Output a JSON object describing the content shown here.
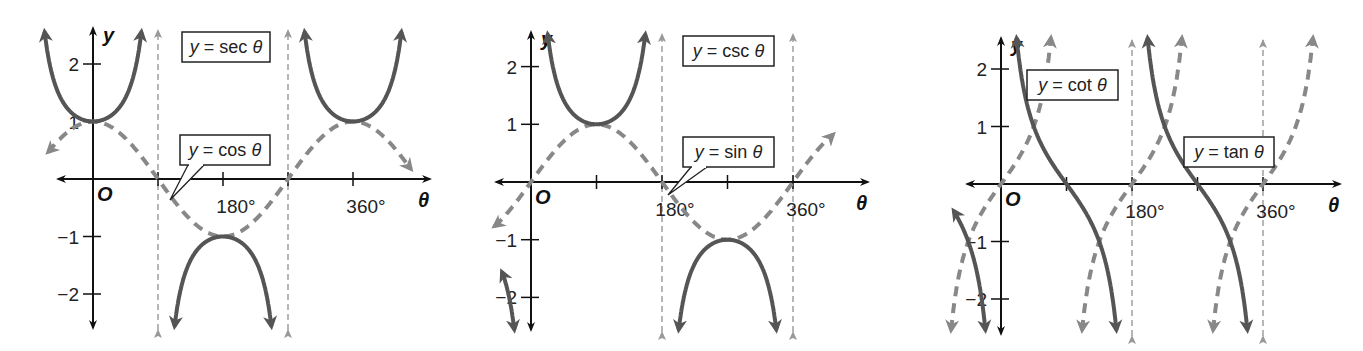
{
  "chart_data": [
    {
      "type": "line",
      "title": "",
      "xlabel": "θ",
      "ylabel": "y",
      "origin_label": "O",
      "x_unit": "degrees",
      "xlim": [
        -75,
        475
      ],
      "ylim": [
        -2.5,
        2.5
      ],
      "x_ticks": [
        90,
        180,
        270,
        360
      ],
      "x_tick_labels": [
        {
          "value": 180,
          "label": "180°"
        },
        {
          "value": 360,
          "label": "360°"
        }
      ],
      "y_ticks": [
        {
          "value": 2,
          "label": "2"
        },
        {
          "value": 1,
          "label": "1"
        },
        {
          "value": -1,
          "label": "−1"
        },
        {
          "value": -2,
          "label": "−2"
        }
      ],
      "asymptotes": [
        90,
        270
      ],
      "grid": false,
      "series": [
        {
          "name": "y = sec θ",
          "function": "sec",
          "style": "solid",
          "color": "#555555",
          "x_range": [
            -70,
            450
          ]
        },
        {
          "name": "y = cos θ",
          "function": "cos",
          "style": "dashed",
          "color": "#888888",
          "x_range": [
            -62,
            440
          ]
        }
      ],
      "annotations": [
        {
          "text_parts": [
            "y",
            " = sec ",
            "θ"
          ],
          "callout": false
        },
        {
          "text_parts": [
            "y",
            " = cos ",
            "θ"
          ],
          "callout": true,
          "points_to_x": 100
        }
      ]
    },
    {
      "type": "line",
      "title": "",
      "xlabel": "θ",
      "ylabel": "y",
      "origin_label": "O",
      "x_unit": "degrees",
      "xlim": [
        -75,
        475
      ],
      "ylim": [
        -2.5,
        2.5
      ],
      "x_ticks": [
        90,
        180,
        270,
        360
      ],
      "x_tick_labels": [
        {
          "value": 180,
          "label": "180°"
        },
        {
          "value": 360,
          "label": "360°"
        }
      ],
      "y_ticks": [
        {
          "value": 2,
          "label": "2"
        },
        {
          "value": 1,
          "label": "1"
        },
        {
          "value": -1,
          "label": "−1"
        },
        {
          "value": -2,
          "label": "−2"
        }
      ],
      "asymptotes": [
        0,
        180,
        360
      ],
      "grid": false,
      "series": [
        {
          "name": "y = csc θ",
          "function": "csc",
          "style": "solid",
          "color": "#555555",
          "x_range": [
            -40,
            360
          ]
        },
        {
          "name": "y = sin θ",
          "function": "sin",
          "style": "dashed",
          "color": "#888888",
          "x_range": [
            -50,
            415
          ]
        }
      ],
      "annotations": [
        {
          "text_parts": [
            "y",
            " = csc ",
            "θ"
          ],
          "callout": false
        },
        {
          "text_parts": [
            "y",
            " = sin ",
            "θ"
          ],
          "callout": true,
          "points_to_x": 188
        }
      ]
    },
    {
      "type": "line",
      "title": "",
      "xlabel": "θ",
      "ylabel": "y",
      "origin_label": "O",
      "x_unit": "degrees",
      "xlim": [
        -75,
        475
      ],
      "ylim": [
        -2.5,
        2.5
      ],
      "x_ticks": [
        90,
        180,
        270,
        360
      ],
      "x_tick_labels": [
        {
          "value": 180,
          "label": "180°"
        },
        {
          "value": 360,
          "label": "360°"
        }
      ],
      "y_ticks": [
        {
          "value": 2,
          "label": "2"
        },
        {
          "value": 1,
          "label": "1"
        },
        {
          "value": -1,
          "label": "−1"
        },
        {
          "value": -2,
          "label": "−2"
        }
      ],
      "asymptotes": [
        180,
        360
      ],
      "grid": false,
      "series": [
        {
          "name": "y = cot θ",
          "function": "cot",
          "style": "solid",
          "color": "#555555",
          "x_range": [
            -65,
            360
          ]
        },
        {
          "name": "y = tan θ",
          "function": "tan",
          "style": "dashed",
          "color": "#888888",
          "x_range": [
            -90,
            450
          ]
        }
      ],
      "annotations": [
        {
          "text_parts": [
            "y",
            " = cot ",
            "θ"
          ],
          "callout": false
        },
        {
          "text_parts": [
            "y",
            " = tan ",
            "θ"
          ],
          "callout": false
        }
      ]
    }
  ]
}
